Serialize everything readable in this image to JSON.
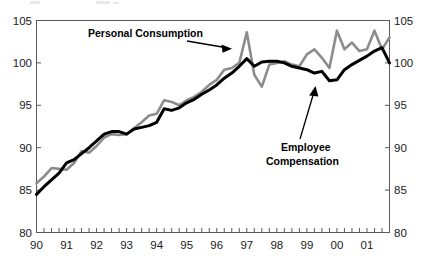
{
  "chart_data": {
    "type": "line",
    "title": "",
    "xlabel": "",
    "ylabel": "",
    "ylim": [
      80,
      105
    ],
    "yticks": [
      80,
      85,
      90,
      95,
      100,
      105
    ],
    "right_axis": {
      "visible": true,
      "ylim": [
        80,
        105
      ],
      "yticks": [
        80,
        85,
        90,
        95,
        100,
        105
      ]
    },
    "grid": false,
    "legend_position": "inline-annotations",
    "x_tick_labels": [
      "90",
      "91",
      "92",
      "93",
      "94",
      "95",
      "96",
      "97",
      "98",
      "99",
      "00",
      "01"
    ],
    "x_minor_tick_interval": "quarterly",
    "x": [
      "1990Q1",
      "1990Q2",
      "1990Q3",
      "1990Q4",
      "1991Q1",
      "1991Q2",
      "1991Q3",
      "1991Q4",
      "1992Q1",
      "1992Q2",
      "1992Q3",
      "1992Q4",
      "1993Q1",
      "1993Q2",
      "1993Q3",
      "1993Q4",
      "1994Q1",
      "1994Q2",
      "1994Q3",
      "1994Q4",
      "1995Q1",
      "1995Q2",
      "1995Q3",
      "1995Q4",
      "1996Q1",
      "1996Q2",
      "1996Q3",
      "1996Q4",
      "1997Q1",
      "1997Q2",
      "1997Q3",
      "1997Q4",
      "1998Q1",
      "1998Q2",
      "1998Q3",
      "1998Q4",
      "1999Q1",
      "1999Q2",
      "1999Q3",
      "1999Q4",
      "2000Q1",
      "2000Q2",
      "2000Q3",
      "2000Q4",
      "2001Q1",
      "2001Q2",
      "2001Q3",
      "2001Q4"
    ],
    "series": [
      {
        "name": "Personal Consumption",
        "color": "#8c8c8c",
        "values": [
          85.8,
          86.6,
          87.6,
          87.5,
          87.4,
          88.2,
          89.6,
          89.4,
          90.2,
          91.2,
          91.6,
          91.5,
          91.6,
          92.3,
          93.0,
          93.8,
          94.0,
          95.6,
          95.4,
          95.0,
          95.6,
          96.0,
          96.6,
          97.4,
          98.0,
          99.2,
          99.4,
          100.0,
          103.6,
          98.6,
          97.2,
          99.8,
          100.0,
          100.2,
          99.8,
          99.6,
          101.0,
          101.6,
          100.6,
          99.4,
          103.8,
          101.6,
          102.4,
          101.4,
          101.6,
          103.8,
          101.6,
          103.0
        ]
      },
      {
        "name": "Employee Compensation",
        "color": "#000000",
        "values": [
          84.5,
          85.4,
          86.2,
          87.0,
          88.2,
          88.6,
          89.3,
          90.0,
          90.8,
          91.6,
          91.9,
          91.9,
          91.6,
          92.2,
          92.4,
          92.6,
          93.0,
          94.6,
          94.4,
          94.7,
          95.3,
          95.7,
          96.3,
          96.8,
          97.4,
          98.2,
          98.8,
          99.6,
          100.5,
          99.6,
          100.1,
          100.2,
          100.2,
          100.0,
          99.6,
          99.4,
          99.2,
          98.8,
          99.0,
          97.9,
          98.0,
          99.2,
          99.8,
          100.3,
          100.8,
          101.4,
          101.8,
          100.0
        ]
      }
    ],
    "annotations": [
      {
        "id": "personal-consumption-annotation",
        "text": "Personal Consumption",
        "points_to": "1997Q1 peak of Personal Consumption series"
      },
      {
        "id": "employee-compensation-annotation",
        "text_line1": "Employee",
        "text_line2": "Compensation",
        "points_to": "1999Q4 trough of Employee Compensation series"
      }
    ]
  }
}
